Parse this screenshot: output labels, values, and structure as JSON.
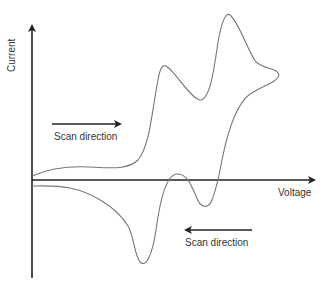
{
  "diagram": {
    "axes": {
      "x_label": "Voltage",
      "y_label": "Current"
    },
    "annotations": {
      "forward_scan": "Scan direction",
      "reverse_scan": "Scan direction"
    },
    "colors": {
      "axis": "#222222",
      "curve": "#777777",
      "text": "#333333"
    }
  }
}
